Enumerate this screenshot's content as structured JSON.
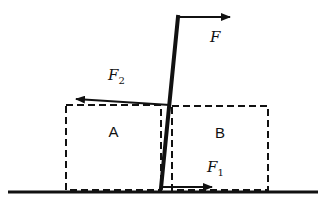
{
  "diagram": {
    "type": "physics-force-diagram",
    "blocks": [
      {
        "id": "A",
        "label": "A",
        "x": 66,
        "y": 105,
        "w": 95,
        "h": 85
      },
      {
        "id": "B",
        "label": "B",
        "x": 172,
        "y": 106,
        "w": 96,
        "h": 84
      }
    ],
    "ground": {
      "x1": 8,
      "x2": 318,
      "y": 192
    },
    "rod": {
      "x1": 161,
      "y1": 188,
      "x2": 178,
      "y2": 17
    },
    "forces": [
      {
        "id": "F",
        "label": "F",
        "subscript": "",
        "x1": 178,
        "y1": 17,
        "x2": 230,
        "y2": 17,
        "label_x": 210,
        "label_y": 42
      },
      {
        "id": "F2",
        "label": "F",
        "subscript": "2",
        "x1": 170,
        "y1": 105,
        "x2": 76,
        "y2": 99,
        "label_x": 108,
        "label_y": 80
      },
      {
        "id": "F1",
        "label": "F",
        "subscript": "1",
        "x1": 162,
        "y1": 187,
        "x2": 212,
        "y2": 187,
        "label_x": 207,
        "label_y": 172
      }
    ],
    "colors": {
      "stroke": "#111111",
      "background": "#ffffff"
    }
  }
}
